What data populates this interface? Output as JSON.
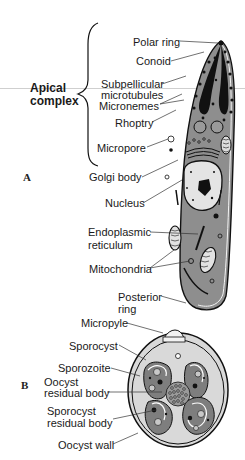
{
  "figure": {
    "panel_a": {
      "panel_label": "A",
      "group_label_line1": "Apical",
      "group_label_line2": "complex",
      "labels": {
        "polar_ring": "Polar ring",
        "conoid": "Conoid",
        "subpellicular_1": "Subpellicular",
        "subpellicular_2": "microtubules",
        "micronemes": "Micronemes",
        "rhoptry": "Rhoptry",
        "micropore": "Micropore",
        "golgi": "Golgi body",
        "nucleus": "Nucleus",
        "er_1": "Endoplasmic",
        "er_2": "reticulum",
        "mitochondria": "Mitochondria",
        "posterior_1": "Posterior",
        "posterior_2": "ring"
      }
    },
    "panel_b": {
      "panel_label": "B",
      "labels": {
        "micropyle": "Micropyle",
        "sporocyst": "Sporocyst",
        "sporozoite": "Sporozoite",
        "oocyst_residual_1": "Oocyst",
        "oocyst_residual_2": "residual body",
        "sporocyst_residual_1": "Sporocyst",
        "sporocyst_residual_2": "residual body",
        "oocyst_wall": "Oocyst wall"
      }
    },
    "colors": {
      "cytoplasm": "#8e8e8e",
      "nucleus": "#e4e4e4",
      "dark": "#141414",
      "oocyst_fill": "#d9d9d9",
      "line": "#333333"
    }
  }
}
